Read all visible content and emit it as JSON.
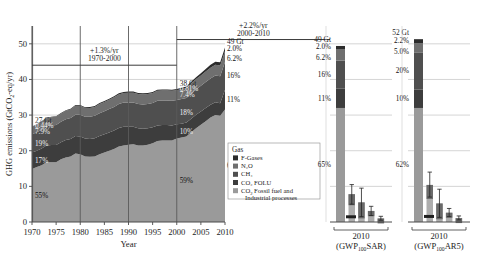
{
  "figure": {
    "type": "stacked-area-with-side-panels",
    "background": "#ffffff"
  },
  "axes": {
    "ylabel": "GHG emissions (GtCO₂-eq/yr)",
    "xlabel": "Year",
    "yticks": [
      "0",
      "10",
      "20",
      "30",
      "40",
      "50"
    ],
    "ylim": [
      0,
      55
    ],
    "xticks": [
      "1970",
      "1975",
      "1980",
      "1985",
      "1990",
      "1995",
      "2000",
      "2005",
      "2010"
    ],
    "xlim": [
      1970,
      2010
    ],
    "grid": true
  },
  "annotations": {
    "rate_1970_2000": {
      "rate": "+1.3%/yr",
      "period": "1970-2000"
    },
    "rate_2000_2010": {
      "rate": "+2.2%/yr",
      "period": "2000-2010"
    }
  },
  "colors": {
    "fgases": "#2b2b2b",
    "n2o": "#6f6f6f",
    "ch4": "#4f4f4f",
    "co2_folu": "#3d3d3d",
    "co2_fossil": "#9a9a9a",
    "grid": "#b9b9b9",
    "axis": "#4a4a4a",
    "marker_line": "#5a5a5a",
    "errorbar": "#222222"
  },
  "legend": {
    "title": "Gas",
    "items": [
      {
        "label": "F-Gases",
        "color": "#2b2b2b"
      },
      {
        "label": "N₂O",
        "color": "#6f6f6f"
      },
      {
        "label": "CH₄",
        "color": "#4f4f4f"
      },
      {
        "label": "CO₂ FOLU",
        "color": "#3d3d3d"
      },
      {
        "label": "CO₂ Fossil fuel and Industrial processes",
        "color": "#9a9a9a"
      }
    ]
  },
  "year_callouts": [
    {
      "year": 1970,
      "total": "27 Gt",
      "shares": [
        "0.44%",
        "7.9%",
        "19%",
        "17%",
        "55%"
      ]
    },
    {
      "year": 2000,
      "total": "38 Gt",
      "shares": [
        "0.81%",
        "7.4%",
        "18%",
        "10%",
        "59%"
      ]
    },
    {
      "year": 2010,
      "total": "49 Gt",
      "shares": [
        "2.0%",
        "6.2%",
        "16%",
        "11%",
        "65%"
      ]
    }
  ],
  "side_panels": [
    {
      "id": "sar",
      "year": "2010",
      "metric": "(GWP₁₀₀SAR)",
      "total": "49 Gt",
      "shares": [
        "2.0%",
        "6.2%",
        "16%",
        "11%",
        "65%"
      ]
    },
    {
      "id": "ar5",
      "year": "2010",
      "metric": "(GWP₁₀₀AR5)",
      "total": "52 Gt",
      "shares": [
        "2.2%",
        "5.0%",
        "20%",
        "10%",
        "62%"
      ]
    }
  ],
  "chart_data": {
    "type": "area",
    "xlabel": "Year",
    "ylabel": "GHG emissions (GtCO₂-eq/yr)",
    "xlim": [
      1970,
      2010
    ],
    "ylim": [
      0,
      55
    ],
    "grid": true,
    "legend_position": "inside-bottom-center",
    "stack_order_bottom_to_top": [
      "CO₂ Fossil fuel and Industrial processes",
      "CO₂ FOLU",
      "CH₄",
      "N₂O",
      "F-Gases"
    ],
    "x": [
      1970,
      1971,
      1972,
      1973,
      1974,
      1975,
      1976,
      1977,
      1978,
      1979,
      1980,
      1981,
      1982,
      1983,
      1984,
      1985,
      1986,
      1987,
      1988,
      1989,
      1990,
      1991,
      1992,
      1993,
      1994,
      1995,
      1996,
      1997,
      1998,
      1999,
      2000,
      2001,
      2002,
      2003,
      2004,
      2005,
      2006,
      2007,
      2008,
      2009,
      2010
    ],
    "series": [
      {
        "name": "CO₂ Fossil fuel and Industrial processes",
        "color": "#9a9a9a",
        "values": [
          14.9,
          15.4,
          15.9,
          16.8,
          16.8,
          16.8,
          17.6,
          18.1,
          18.4,
          19.2,
          19.0,
          18.4,
          18.3,
          18.4,
          19.0,
          19.5,
          20.0,
          20.5,
          21.2,
          21.5,
          21.7,
          21.8,
          21.5,
          21.5,
          21.7,
          22.1,
          22.7,
          22.9,
          22.9,
          22.9,
          23.4,
          23.7,
          24.0,
          25.2,
          26.3,
          27.3,
          28.3,
          29.3,
          30.0,
          29.8,
          31.6
        ]
      },
      {
        "name": "CO₂ FOLU",
        "color": "#3d3d3d",
        "values": [
          4.6,
          4.6,
          4.7,
          4.7,
          4.8,
          4.8,
          4.8,
          4.9,
          4.9,
          4.9,
          5.0,
          5.0,
          5.0,
          5.1,
          5.1,
          5.1,
          5.1,
          5.2,
          5.2,
          5.2,
          5.0,
          4.9,
          4.8,
          4.7,
          4.6,
          4.5,
          4.4,
          4.3,
          4.3,
          4.2,
          4.0,
          3.9,
          3.9,
          3.8,
          3.8,
          3.7,
          3.7,
          3.6,
          3.6,
          3.5,
          5.5
        ]
      },
      {
        "name": "CH₄",
        "color": "#4f4f4f",
        "values": [
          5.1,
          5.2,
          5.3,
          5.4,
          5.5,
          5.6,
          5.7,
          5.8,
          5.9,
          6.0,
          6.1,
          6.1,
          6.2,
          6.3,
          6.4,
          6.5,
          6.6,
          6.6,
          6.7,
          6.8,
          6.8,
          6.8,
          6.8,
          6.8,
          6.8,
          6.8,
          6.9,
          6.9,
          6.9,
          6.9,
          6.8,
          6.9,
          6.9,
          7.0,
          7.1,
          7.2,
          7.3,
          7.4,
          7.5,
          7.6,
          7.8
        ]
      },
      {
        "name": "N₂O",
        "color": "#6f6f6f",
        "values": [
          2.1,
          2.1,
          2.2,
          2.2,
          2.3,
          2.3,
          2.3,
          2.4,
          2.4,
          2.5,
          2.5,
          2.5,
          2.5,
          2.5,
          2.6,
          2.6,
          2.6,
          2.7,
          2.7,
          2.7,
          2.8,
          2.8,
          2.8,
          2.8,
          2.8,
          2.8,
          2.8,
          2.8,
          2.8,
          2.8,
          2.8,
          2.8,
          2.8,
          2.9,
          2.9,
          2.9,
          2.9,
          3.0,
          3.0,
          3.0,
          3.1
        ]
      },
      {
        "name": "F-Gases",
        "color": "#2b2b2b",
        "values": [
          0.12,
          0.13,
          0.14,
          0.15,
          0.16,
          0.17,
          0.18,
          0.19,
          0.2,
          0.21,
          0.22,
          0.23,
          0.24,
          0.25,
          0.26,
          0.27,
          0.28,
          0.29,
          0.3,
          0.3,
          0.31,
          0.31,
          0.31,
          0.3,
          0.3,
          0.3,
          0.3,
          0.3,
          0.31,
          0.31,
          0.31,
          0.35,
          0.4,
          0.47,
          0.55,
          0.63,
          0.72,
          0.8,
          0.88,
          0.93,
          1.0
        ]
      }
    ],
    "totals": {
      "1970": 27,
      "2000": 38,
      "2010": 49
    },
    "side_panel_bars": [
      {
        "panel": "2010 (GWP₁₀₀SAR)",
        "total": 49,
        "bars": [
          {
            "name": "CO₂ Fossil fuel and Industrial processes",
            "value": 32.0,
            "err_low": 29.0,
            "err_high": 35.0
          },
          {
            "name": "CO₂ FOLU",
            "value": 5.5,
            "err_low": 1.5,
            "err_high": 9.5
          },
          {
            "name": "CH₄",
            "value": 7.8,
            "err_low": 5.0,
            "err_high": 10.5
          },
          {
            "name": "N₂O",
            "value": 3.1,
            "err_low": 1.8,
            "err_high": 4.4
          },
          {
            "name": "F-Gases",
            "value": 1.0,
            "err_low": 0.5,
            "err_high": 1.6
          }
        ]
      },
      {
        "panel": "2010 (GWP₁₀₀AR5)",
        "total": 52,
        "bars": [
          {
            "name": "CO₂ Fossil fuel and Industrial processes",
            "value": 32.0,
            "err_low": 29.0,
            "err_high": 35.0
          },
          {
            "name": "CO₂ FOLU",
            "value": 5.2,
            "err_low": 1.3,
            "err_high": 9.2
          },
          {
            "name": "CH₄",
            "value": 10.4,
            "err_low": 7.0,
            "err_high": 14.0
          },
          {
            "name": "N₂O",
            "value": 2.6,
            "err_low": 1.5,
            "err_high": 3.8
          },
          {
            "name": "F-Gases",
            "value": 1.1,
            "err_low": 0.6,
            "err_high": 1.7
          }
        ]
      }
    ]
  }
}
